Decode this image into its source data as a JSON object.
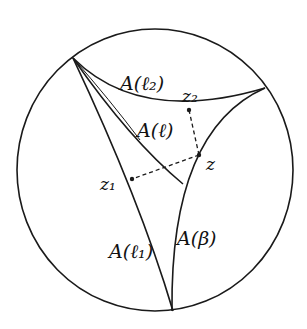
{
  "diagram": {
    "type": "hyperbolic-disk",
    "labels": {
      "arc_top": "A(ℓ₂)",
      "arc_mid": "A(ℓ)",
      "arc_left": "A(ℓ₁)",
      "arc_right": "A(β)",
      "point_z": "z",
      "point_z1": "z₁",
      "point_z2": "z₂"
    },
    "colors": {
      "stroke": "#1a1a1a",
      "background": "#ffffff"
    }
  }
}
